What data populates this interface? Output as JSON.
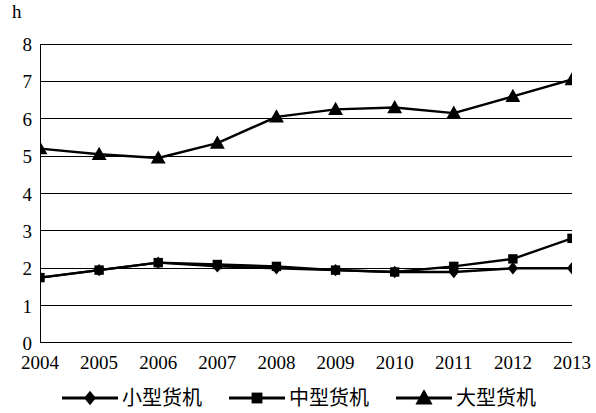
{
  "chart_data": {
    "type": "line",
    "title": "",
    "subtitle": "",
    "xlabel": "",
    "ylabel": "h",
    "unit_label": "h",
    "categories": [
      "2004",
      "2005",
      "2006",
      "2007",
      "2008",
      "2009",
      "2010",
      "2011",
      "2012",
      "2013"
    ],
    "x": [
      2004,
      2005,
      2006,
      2007,
      2008,
      2009,
      2010,
      2011,
      2012,
      2013
    ],
    "ylim": [
      0,
      8
    ],
    "yticks": [
      0,
      1,
      2,
      3,
      4,
      5,
      6,
      7,
      8
    ],
    "ytick_labels": [
      "0",
      "1",
      "2",
      "3",
      "4",
      "5",
      "6",
      "7",
      "8"
    ],
    "grid": true,
    "grid_axis": "y",
    "legend_position": "bottom",
    "series": [
      {
        "name": "小型货机",
        "marker": "diamond",
        "color": "#000000",
        "values": [
          1.75,
          1.95,
          2.15,
          2.05,
          2.0,
          1.95,
          1.9,
          1.9,
          2.0,
          2.0
        ]
      },
      {
        "name": "中型货机",
        "marker": "square",
        "color": "#000000",
        "values": [
          1.75,
          1.95,
          2.15,
          2.1,
          2.05,
          1.95,
          1.9,
          2.05,
          2.25,
          2.8
        ]
      },
      {
        "name": "大型货机",
        "marker": "triangle",
        "color": "#000000",
        "values": [
          5.2,
          5.05,
          4.95,
          5.35,
          6.05,
          6.25,
          6.3,
          6.15,
          6.6,
          7.05
        ]
      }
    ]
  },
  "legend": {
    "items": [
      {
        "label": "小型货机",
        "marker": "diamond"
      },
      {
        "label": "中型货机",
        "marker": "square"
      },
      {
        "label": "大型货机",
        "marker": "triangle"
      }
    ]
  }
}
